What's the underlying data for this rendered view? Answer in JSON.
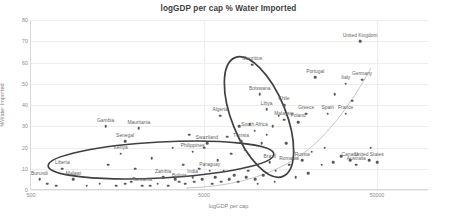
{
  "chart_data": {
    "type": "scatter",
    "title": "logGDP per cap % Water Imported",
    "xlabel": "logGDP per cap",
    "ylabel": "%Water Imported",
    "xscale": "log",
    "xlim": [
      500,
      100000
    ],
    "ylim": [
      0,
      80
    ],
    "xticks": [
      "500",
      "5000",
      "50000"
    ],
    "xtick_values": [
      500,
      5000,
      50000
    ],
    "yticks": [
      "0",
      "10",
      "20",
      "30",
      "40",
      "50",
      "60",
      "70",
      "80"
    ],
    "ytick_values": [
      0,
      10,
      20,
      30,
      40,
      50,
      60,
      70,
      80
    ],
    "grid": true,
    "legend": "none",
    "points": [
      {
        "label": "United Kingdom",
        "x": 40000,
        "y": 70
      },
      {
        "label": "Mauritius",
        "x": 9500,
        "y": 59
      },
      {
        "label": "Portugal",
        "x": 22000,
        "y": 53
      },
      {
        "label": "Germany",
        "x": 41000,
        "y": 52
      },
      {
        "label": "Italy",
        "x": 33000,
        "y": 50
      },
      {
        "label": "Botswana",
        "x": 10500,
        "y": 45
      },
      {
        "label": "Chile",
        "x": 14500,
        "y": 40
      },
      {
        "label": "Libya",
        "x": 11500,
        "y": 38
      },
      {
        "label": "Greece",
        "x": 19500,
        "y": 36
      },
      {
        "label": "Spain",
        "x": 26000,
        "y": 36
      },
      {
        "label": "France",
        "x": 33000,
        "y": 36
      },
      {
        "label": "Algeria",
        "x": 6200,
        "y": 35
      },
      {
        "label": "Malaysia",
        "x": 14500,
        "y": 33
      },
      {
        "label": "Poland",
        "x": 17500,
        "y": 32
      },
      {
        "label": "Gambia",
        "x": 1350,
        "y": 30
      },
      {
        "label": "Mauritania",
        "x": 2100,
        "y": 29
      },
      {
        "label": "South Africa",
        "x": 9800,
        "y": 28
      },
      {
        "label": "Senegal",
        "x": 1750,
        "y": 23
      },
      {
        "label": "Tunisia",
        "x": 8200,
        "y": 23
      },
      {
        "label": "Swaziland",
        "x": 5200,
        "y": 22
      },
      {
        "label": "Philippines",
        "x": 4300,
        "y": 18
      },
      {
        "label": "Kenya",
        "x": 1650,
        "y": 17
      },
      {
        "label": "Canada",
        "x": 35000,
        "y": 14
      },
      {
        "label": "United States",
        "x": 45000,
        "y": 14
      },
      {
        "label": "Australia",
        "x": 38000,
        "y": 12
      },
      {
        "label": "Brazil",
        "x": 12000,
        "y": 13
      },
      {
        "label": "Russia",
        "x": 18500,
        "y": 14
      },
      {
        "label": "Romania",
        "x": 15500,
        "y": 12
      },
      {
        "label": "Paraguay",
        "x": 5400,
        "y": 9
      },
      {
        "label": "India",
        "x": 4300,
        "y": 6
      },
      {
        "label": "Liberia",
        "x": 760,
        "y": 10
      },
      {
        "label": "Burundi",
        "x": 560,
        "y": 5
      },
      {
        "label": "Malawi",
        "x": 880,
        "y": 5
      },
      {
        "label": "Zambia",
        "x": 2900,
        "y": 6
      },
      {
        "label": "Tanzania",
        "x": 2200,
        "y": 2
      },
      {
        "label": "Bolivia",
        "x": 3600,
        "y": 4
      }
    ],
    "unlabeled_points": [
      {
        "x": 620,
        "y": 3
      },
      {
        "x": 700,
        "y": 2
      },
      {
        "x": 1050,
        "y": 2
      },
      {
        "x": 1250,
        "y": 3
      },
      {
        "x": 1550,
        "y": 2
      },
      {
        "x": 1750,
        "y": 3
      },
      {
        "x": 1900,
        "y": 4
      },
      {
        "x": 2450,
        "y": 2
      },
      {
        "x": 2700,
        "y": 3
      },
      {
        "x": 3100,
        "y": 2
      },
      {
        "x": 3400,
        "y": 5
      },
      {
        "x": 3900,
        "y": 3
      },
      {
        "x": 4400,
        "y": 4
      },
      {
        "x": 4900,
        "y": 5
      },
      {
        "x": 5600,
        "y": 3
      },
      {
        "x": 6300,
        "y": 4
      },
      {
        "x": 7000,
        "y": 5
      },
      {
        "x": 7900,
        "y": 4
      },
      {
        "x": 8800,
        "y": 6
      },
      {
        "x": 9900,
        "y": 5
      },
      {
        "x": 3800,
        "y": 12
      },
      {
        "x": 4700,
        "y": 10
      },
      {
        "x": 6500,
        "y": 9
      },
      {
        "x": 7500,
        "y": 7
      },
      {
        "x": 9000,
        "y": 9
      },
      {
        "x": 11000,
        "y": 7
      },
      {
        "x": 13000,
        "y": 9
      },
      {
        "x": 6000,
        "y": 14
      },
      {
        "x": 7200,
        "y": 17
      },
      {
        "x": 8600,
        "y": 19
      },
      {
        "x": 5000,
        "y": 20
      },
      {
        "x": 6800,
        "y": 25
      },
      {
        "x": 8000,
        "y": 30
      },
      {
        "x": 9200,
        "y": 31
      },
      {
        "x": 11500,
        "y": 26
      },
      {
        "x": 12500,
        "y": 30
      },
      {
        "x": 13500,
        "y": 35
      },
      {
        "x": 10800,
        "y": 22
      },
      {
        "x": 15000,
        "y": 22
      },
      {
        "x": 16500,
        "y": 18
      },
      {
        "x": 21000,
        "y": 18
      },
      {
        "x": 25000,
        "y": 20
      },
      {
        "x": 28000,
        "y": 13
      },
      {
        "x": 31000,
        "y": 16
      },
      {
        "x": 24000,
        "y": 12
      },
      {
        "x": 50000,
        "y": 13
      },
      {
        "x": 46000,
        "y": 20
      },
      {
        "x": 36000,
        "y": 42
      },
      {
        "x": 28500,
        "y": 45
      },
      {
        "x": 4100,
        "y": 26
      },
      {
        "x": 3300,
        "y": 20
      },
      {
        "x": 2500,
        "y": 15
      },
      {
        "x": 1400,
        "y": 12
      },
      {
        "x": 2000,
        "y": 10
      },
      {
        "x": 5800,
        "y": 6
      },
      {
        "x": 17000,
        "y": 6
      },
      {
        "x": 20000,
        "y": 8
      },
      {
        "x": 12800,
        "y": 4
      },
      {
        "x": 10200,
        "y": 3
      }
    ],
    "annotations": [
      {
        "kind": "ellipse",
        "name": "upper-cluster-ellipse",
        "color": "#404040"
      },
      {
        "kind": "ellipse",
        "name": "lower-cluster-ellipse",
        "color": "#404040"
      },
      {
        "kind": "trendline",
        "name": "exponential-trend-curve",
        "color": "#bfbfbf"
      }
    ],
    "colors": {
      "marker": "#595959",
      "grid": "#ededed",
      "axis": "#d9d9d9",
      "text": "#7f7f7f",
      "title": "#3f3f3f",
      "ellipse": "#404040",
      "trend": "#bfbfbf",
      "background": "#ffffff"
    }
  }
}
